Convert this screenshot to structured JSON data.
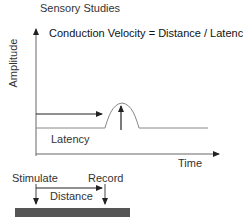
{
  "title": "Sensory Studies",
  "formula": "Conduction Velocity = Distance / Latency",
  "axes": {
    "y_label": "Amplitude",
    "x_label": "Time"
  },
  "labels": {
    "latency": "Latency",
    "stimulate": "Stimulate",
    "record": "Record",
    "distance": "Distance"
  },
  "colors": {
    "line": "#333333",
    "signal": "#888888",
    "nerve_bar": "#555555"
  }
}
